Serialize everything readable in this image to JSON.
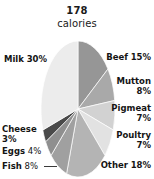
{
  "chart_data": {
    "type": "pie",
    "title": "178 calories",
    "title_lines": [
      "178",
      "calories"
    ],
    "categories": [
      "Beef",
      "Mutton",
      "Pigmeat",
      "Poultry",
      "Other",
      "Fish",
      "Eggs",
      "Cheese",
      "Milk"
    ],
    "values": [
      15,
      8,
      7,
      7,
      18,
      8,
      4,
      3,
      30
    ],
    "value_unit": "%",
    "total_label": "178 calories",
    "xlabel": "",
    "ylabel": "",
    "legend_position": "outside-labels",
    "grid": false,
    "start_angle_deg": 0,
    "direction": "clockwise",
    "slice_colors": [
      "#969696",
      "#a9a9a9",
      "#d2d2d2",
      "#e2e2e2",
      "#b4b4b4",
      "#a0a0a0",
      "#8f8f8f",
      "#4a4a4a",
      "#ececec"
    ],
    "stroke_color": "#ffffff"
  },
  "title": {
    "line1": "178",
    "line2": "calories"
  },
  "labels": {
    "beef": {
      "name": "Beef",
      "percent": "15%"
    },
    "mutton": {
      "name": "Mutton",
      "percent": "8%"
    },
    "pigmeat": {
      "name": "Pigmeat",
      "percent": "7%"
    },
    "poultry": {
      "name": "Poultry",
      "percent": "7%"
    },
    "other": {
      "name": "Other",
      "percent": "18%"
    },
    "milk": {
      "name": "Milk",
      "percent": "30%"
    },
    "cheese": {
      "name": "Cheese",
      "percent": "3%"
    },
    "eggs": {
      "name": "Eggs",
      "percent": "4%"
    },
    "fish": {
      "name": "Fish",
      "percent": "8%"
    }
  }
}
